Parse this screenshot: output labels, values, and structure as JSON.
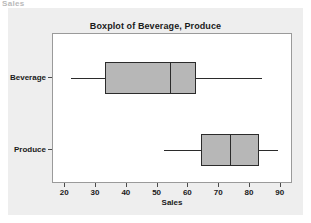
{
  "scan": {
    "top_fragment": "Sales"
  },
  "chart_data": {
    "type": "boxplot",
    "title": "Boxplot of Beverage, Produce",
    "xlabel": "Sales",
    "ylabel": "",
    "orientation": "horizontal",
    "xlim": [
      16,
      94
    ],
    "grid": false,
    "legend": null,
    "xticks": [
      20,
      30,
      40,
      50,
      60,
      70,
      80,
      90
    ],
    "xtick_labels": [
      "20",
      "30",
      "40",
      "50",
      "60",
      "70",
      "80",
      "90"
    ],
    "categories": [
      "Beverage",
      "Produce"
    ],
    "boxes": [
      {
        "name": "Beverage",
        "whisker_low": 22,
        "q1": 33,
        "median": 54,
        "q3": 62.5,
        "whisker_high": 84
      },
      {
        "name": "Produce",
        "whisker_low": 52,
        "q1": 64,
        "median": 73.5,
        "q3": 83,
        "whisker_high": 89
      }
    ],
    "colors": {
      "box_fill": "#b7b7b7",
      "box_edge": "#2b2b2b",
      "panel_background": "#eeeeee",
      "plot_background": "#ffffff",
      "frame": "#9a9a9a",
      "text": "#1a1a1a"
    }
  }
}
